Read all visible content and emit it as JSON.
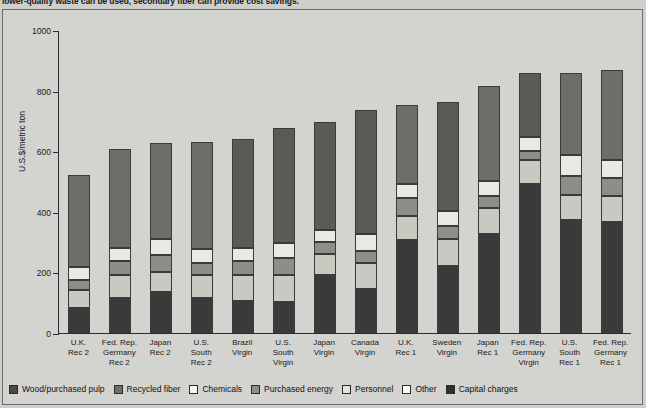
{
  "caption": "lower-quality waste can be used, secondary fiber can provide cost savings.",
  "chart_data": {
    "type": "bar",
    "subtype": "stacked-bar",
    "title": "",
    "xlabel": "",
    "ylabel": "U.S.$/metric ton",
    "ylim": [
      0,
      1000
    ],
    "yticks": [
      "0",
      "200",
      "400",
      "600",
      "800",
      "1000"
    ],
    "grid": false,
    "legend_position": "bottom",
    "stack_order_bottom_to_top": [
      "Capital charges",
      "Other",
      "Personnel",
      "Purchased energy",
      "Chemicals",
      "Recycled fiber",
      "Wood/purchased pulp"
    ],
    "categories": [
      "U.K.\nRec 2",
      "Fed. Rep.\nGermany\nRec 2",
      "Japan\nRec 2",
      "U.S.\nSouth\nRec 2",
      "Brazil\nVirgin",
      "U.S.\nSouth\nVirgin",
      "Japan\nVirgin",
      "Canada\nVirgin",
      "U.K.\nRec 1",
      "Sweden\nVirgin",
      "Japan\nRec 1",
      "Fed. Rep.\nGermany\nVirgin",
      "U.S.\nSouth\nRec 1",
      "Fed. Rep.\nGermany\nRec 1"
    ],
    "totals": [
      520,
      605,
      625,
      630,
      640,
      675,
      695,
      735,
      750,
      760,
      815,
      855,
      855,
      865
    ],
    "series": [
      {
        "name": "Capital charges",
        "color": "#3a3a3a",
        "values": [
          75,
          110,
          130,
          110,
          100,
          95,
          185,
          140,
          300,
          215,
          320,
          485,
          365,
          360
        ]
      },
      {
        "name": "Other",
        "color": "#f2f2ee",
        "values": [
          5,
          5,
          5,
          5,
          5,
          5,
          5,
          5,
          5,
          5,
          5,
          5,
          5,
          5
        ]
      },
      {
        "name": "Personnel",
        "color": "#c9c9c2",
        "values": [
          60,
          75,
          65,
          75,
          85,
          90,
          70,
          85,
          80,
          90,
          85,
          80,
          85,
          85
        ]
      },
      {
        "name": "Purchased energy",
        "color": "#8e8e88",
        "values": [
          35,
          45,
          55,
          40,
          45,
          55,
          40,
          40,
          60,
          40,
          40,
          30,
          60,
          60
        ]
      },
      {
        "name": "Chemicals",
        "color": "#e9e9e4",
        "values": [
          40,
          45,
          55,
          45,
          45,
          50,
          40,
          55,
          45,
          50,
          50,
          45,
          70,
          60
        ]
      },
      {
        "name": "Recycled fiber",
        "color": "#6e6e68",
        "values": [
          305,
          325,
          315,
          355,
          0,
          0,
          0,
          0,
          260,
          0,
          315,
          0,
          270,
          295
        ]
      },
      {
        "name": "Wood/purchased pulp",
        "color": "#5b5b56",
        "values": [
          0,
          0,
          0,
          0,
          360,
          380,
          355,
          410,
          0,
          360,
          0,
          210,
          0,
          0
        ]
      }
    ]
  },
  "legend": [
    {
      "label": "Wood/purchased pulp",
      "color": "#4a4a45"
    },
    {
      "label": "Recycled fiber",
      "color": "#6e6e68"
    },
    {
      "label": "Chemicals",
      "color": "#f4f4f0"
    },
    {
      "label": "Purchased energy",
      "color": "#8e8e88"
    },
    {
      "label": "Personnel",
      "color": "#e4e4df"
    },
    {
      "label": "Other",
      "color": "#fbfbf8"
    },
    {
      "label": "Capital charges",
      "color": "#2f2f2c"
    }
  ]
}
